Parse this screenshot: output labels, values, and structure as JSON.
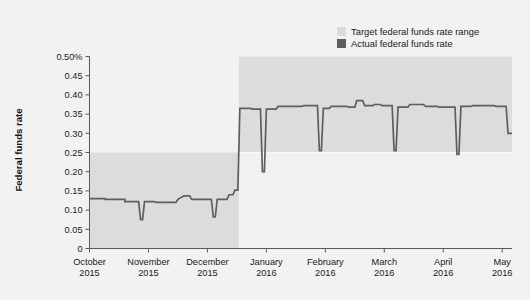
{
  "chart_data": {
    "type": "area",
    "title": "",
    "xlabel": "",
    "ylabel": "Federal funds rate",
    "ylim": [
      0,
      0.5
    ],
    "xlim": [
      "2015-10-01",
      "2016-05-05"
    ],
    "grid": false,
    "legend_position": "top-right",
    "y_ticks": [
      "0.50%",
      "0.45",
      "0.40",
      "0.35",
      "0.30",
      "0.25",
      "0.20",
      "0.15",
      "0.10",
      "0.05",
      "0"
    ],
    "y_tick_values": [
      0.5,
      0.45,
      0.4,
      0.35,
      0.3,
      0.25,
      0.2,
      0.15,
      0.1,
      0.05,
      0
    ],
    "x_ticks": [
      {
        "month": "October",
        "year": "2015"
      },
      {
        "month": "November",
        "year": "2015"
      },
      {
        "month": "December",
        "year": "2015"
      },
      {
        "month": "January",
        "year": "2016"
      },
      {
        "month": "February",
        "year": "2016"
      },
      {
        "month": "March",
        "year": "2016"
      },
      {
        "month": "April",
        "year": "2016"
      },
      {
        "month": "May",
        "year": "2016"
      }
    ],
    "legend": [
      {
        "label": "Target federal funds rate range",
        "color": "#dcdcdc",
        "key": "target-range"
      },
      {
        "label": "Actual federal funds rate",
        "color": "#5e5e5e",
        "key": "actual-rate"
      }
    ],
    "series": [
      {
        "name": "Target federal funds rate range",
        "type": "band",
        "color": "#dcdcdc",
        "segments": [
          {
            "x_start": 0.0,
            "x_end": 76.0,
            "low": 0.0,
            "high": 0.25
          },
          {
            "x_start": 76.0,
            "x_end": 215.0,
            "low": 0.25,
            "high": 0.5
          }
        ]
      },
      {
        "name": "Actual federal funds rate",
        "type": "line",
        "color": "#5e5e5e",
        "points": [
          [
            0.0,
            0.13
          ],
          [
            8.0,
            0.13
          ],
          [
            8.0,
            0.128
          ],
          [
            18.0,
            0.128
          ],
          [
            18.0,
            0.122
          ],
          [
            25.0,
            0.122
          ],
          [
            26.0,
            0.075
          ],
          [
            27.0,
            0.075
          ],
          [
            28.0,
            0.122
          ],
          [
            33.0,
            0.122
          ],
          [
            34.0,
            0.12
          ],
          [
            44.0,
            0.12
          ],
          [
            45.0,
            0.128
          ],
          [
            48.0,
            0.137
          ],
          [
            51.0,
            0.137
          ],
          [
            52.0,
            0.128
          ],
          [
            56.0,
            0.128
          ],
          [
            57.0,
            0.128
          ],
          [
            62.0,
            0.128
          ],
          [
            63.0,
            0.082
          ],
          [
            64.0,
            0.082
          ],
          [
            65.0,
            0.128
          ],
          [
            70.0,
            0.128
          ],
          [
            71.0,
            0.14
          ],
          [
            73.0,
            0.14
          ],
          [
            74.0,
            0.152
          ],
          [
            75.5,
            0.152
          ],
          [
            76.5,
            0.365
          ],
          [
            82.0,
            0.365
          ],
          [
            83.0,
            0.363
          ],
          [
            87.0,
            0.363
          ],
          [
            88.0,
            0.2
          ],
          [
            89.0,
            0.2
          ],
          [
            90.0,
            0.363
          ],
          [
            95.0,
            0.363
          ],
          [
            96.0,
            0.37
          ],
          [
            108.0,
            0.37
          ],
          [
            109.0,
            0.372
          ],
          [
            116.0,
            0.372
          ],
          [
            117.0,
            0.255
          ],
          [
            118.0,
            0.255
          ],
          [
            119.0,
            0.365
          ],
          [
            122.0,
            0.365
          ],
          [
            123.0,
            0.37
          ],
          [
            131.0,
            0.37
          ],
          [
            132.0,
            0.368
          ],
          [
            135.0,
            0.368
          ],
          [
            136.0,
            0.385
          ],
          [
            139.0,
            0.385
          ],
          [
            140.0,
            0.372
          ],
          [
            144.0,
            0.372
          ],
          [
            145.0,
            0.375
          ],
          [
            148.0,
            0.375
          ],
          [
            149.0,
            0.372
          ],
          [
            154.0,
            0.372
          ],
          [
            155.0,
            0.255
          ],
          [
            156.0,
            0.255
          ],
          [
            157.0,
            0.368
          ],
          [
            162.0,
            0.368
          ],
          [
            163.0,
            0.375
          ],
          [
            170.0,
            0.375
          ],
          [
            171.0,
            0.37
          ],
          [
            177.0,
            0.37
          ],
          [
            178.0,
            0.368
          ],
          [
            186.0,
            0.368
          ],
          [
            187.0,
            0.245
          ],
          [
            188.0,
            0.245
          ],
          [
            189.0,
            0.37
          ],
          [
            194.0,
            0.37
          ],
          [
            195.0,
            0.372
          ],
          [
            206.0,
            0.372
          ],
          [
            207.0,
            0.37
          ],
          [
            212.0,
            0.37
          ],
          [
            213.0,
            0.3
          ],
          [
            215.0,
            0.3
          ]
        ]
      }
    ],
    "annotations": []
  }
}
